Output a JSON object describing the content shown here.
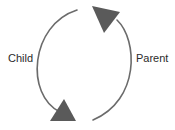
{
  "diagram": {
    "type": "cycle",
    "nodes": [
      {
        "id": "child",
        "label": "Child"
      },
      {
        "id": "parent",
        "label": "Parent"
      }
    ],
    "edges": [
      {
        "from": "child",
        "to": "parent",
        "direction": "upward-left-arc"
      },
      {
        "from": "parent",
        "to": "child",
        "direction": "downward-right-arc"
      }
    ],
    "colors": {
      "stroke": "#6b6b6b",
      "arrowhead": "#5a5a5a",
      "text": "#2b2b2b",
      "background": "#ffffff"
    }
  }
}
